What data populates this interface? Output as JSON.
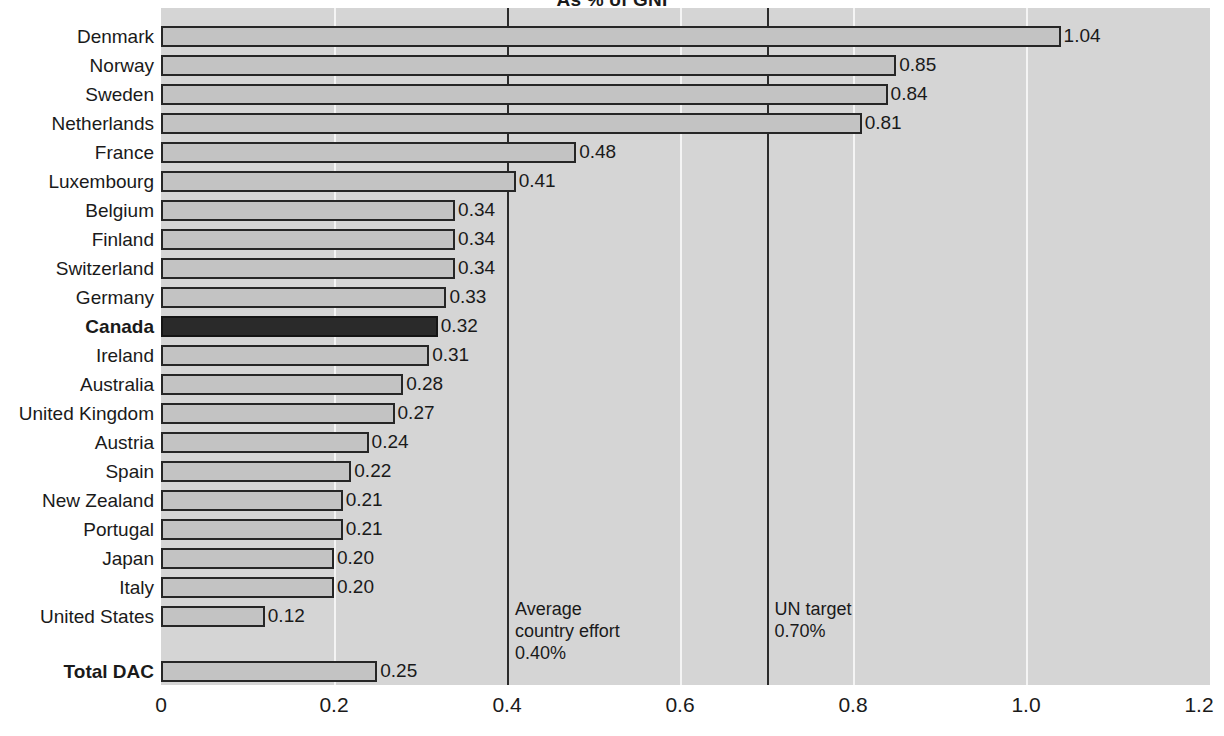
{
  "chart_data": {
    "type": "bar",
    "orientation": "horizontal",
    "title": "As % of GNI",
    "xlabel": "",
    "ylabel": "",
    "xlim": [
      0,
      1.2
    ],
    "xticks": [
      "0",
      "0.2",
      "0.4",
      "0.6",
      "0.8",
      "1.0",
      "1.2"
    ],
    "xtick_values": [
      0,
      0.2,
      0.4,
      0.6,
      0.8,
      1.0,
      1.2
    ],
    "grid": true,
    "legend": "none",
    "categories": [
      "Denmark",
      "Norway",
      "Sweden",
      "Netherlands",
      "France",
      "Luxembourg",
      "Belgium",
      "Finland",
      "Switzerland",
      "Germany",
      "Canada",
      "Ireland",
      "Australia",
      "United Kingdom",
      "Austria",
      "Spain",
      "New Zealand",
      "Portugal",
      "Japan",
      "Italy",
      "United States",
      "Total DAC"
    ],
    "values": [
      1.04,
      0.85,
      0.84,
      0.81,
      0.48,
      0.41,
      0.34,
      0.34,
      0.34,
      0.33,
      0.32,
      0.31,
      0.28,
      0.27,
      0.24,
      0.22,
      0.21,
      0.21,
      0.2,
      0.2,
      0.12,
      0.25
    ],
    "value_labels": [
      "1.04",
      "0.85",
      "0.84",
      "0.81",
      "0.48",
      "0.41",
      "0.34",
      "0.34",
      "0.34",
      "0.33",
      "0.32",
      "0.31",
      "0.28",
      "0.27",
      "0.24",
      "0.22",
      "0.21",
      "0.21",
      "0.20",
      "0.20",
      "0.12",
      "0.25"
    ],
    "highlighted": [
      "Canada"
    ],
    "emphasized": [
      "Canada",
      "Total DAC"
    ],
    "separated_after": "United States",
    "reference_lines": [
      {
        "value": 0.4,
        "label": "Average\ncountry effort\n0.40%"
      },
      {
        "value": 0.7,
        "label": "UN target\n0.70%"
      }
    ]
  },
  "bars": [
    {
      "label": "Denmark",
      "value": 1.04,
      "value_label": "1.04",
      "bold": false,
      "dark": false
    },
    {
      "label": "Norway",
      "value": 0.85,
      "value_label": "0.85",
      "bold": false,
      "dark": false
    },
    {
      "label": "Sweden",
      "value": 0.84,
      "value_label": "0.84",
      "bold": false,
      "dark": false
    },
    {
      "label": "Netherlands",
      "value": 0.81,
      "value_label": "0.81",
      "bold": false,
      "dark": false
    },
    {
      "label": "France",
      "value": 0.48,
      "value_label": "0.48",
      "bold": false,
      "dark": false
    },
    {
      "label": "Luxembourg",
      "value": 0.41,
      "value_label": "0.41",
      "bold": false,
      "dark": false
    },
    {
      "label": "Belgium",
      "value": 0.34,
      "value_label": "0.34",
      "bold": false,
      "dark": false
    },
    {
      "label": "Finland",
      "value": 0.34,
      "value_label": "0.34",
      "bold": false,
      "dark": false
    },
    {
      "label": "Switzerland",
      "value": 0.34,
      "value_label": "0.34",
      "bold": false,
      "dark": false
    },
    {
      "label": "Germany",
      "value": 0.33,
      "value_label": "0.33",
      "bold": false,
      "dark": false
    },
    {
      "label": "Canada",
      "value": 0.32,
      "value_label": "0.32",
      "bold": true,
      "dark": true
    },
    {
      "label": "Ireland",
      "value": 0.31,
      "value_label": "0.31",
      "bold": false,
      "dark": false
    },
    {
      "label": "Australia",
      "value": 0.28,
      "value_label": "0.28",
      "bold": false,
      "dark": false
    },
    {
      "label": "United Kingdom",
      "value": 0.27,
      "value_label": "0.27",
      "bold": false,
      "dark": false
    },
    {
      "label": "Austria",
      "value": 0.24,
      "value_label": "0.24",
      "bold": false,
      "dark": false
    },
    {
      "label": "Spain",
      "value": 0.22,
      "value_label": "0.22",
      "bold": false,
      "dark": false
    },
    {
      "label": "New Zealand",
      "value": 0.21,
      "value_label": "0.21",
      "bold": false,
      "dark": false
    },
    {
      "label": "Portugal",
      "value": 0.21,
      "value_label": "0.21",
      "bold": false,
      "dark": false
    },
    {
      "label": "Japan",
      "value": 0.2,
      "value_label": "0.20",
      "bold": false,
      "dark": false
    },
    {
      "label": "Italy",
      "value": 0.2,
      "value_label": "0.20",
      "bold": false,
      "dark": false
    },
    {
      "label": "United States",
      "value": 0.12,
      "value_label": "0.12",
      "bold": false,
      "dark": false
    },
    {
      "label": "Total DAC",
      "value": 0.25,
      "value_label": "0.25",
      "bold": true,
      "dark": false,
      "gap_before": true
    }
  ],
  "annotations": [
    {
      "name": "average-country-effort-note",
      "value": 0.4,
      "lines": [
        "Average",
        "country effort",
        "0.40%"
      ]
    },
    {
      "name": "un-target-note",
      "value": 0.7,
      "lines": [
        "UN target",
        "0.70%"
      ]
    }
  ],
  "axis": {
    "ticks": [
      "0",
      "0.2",
      "0.4",
      "0.6",
      "0.8",
      "1.0",
      "1.2"
    ]
  },
  "colors": {
    "plot_background": "#d5d5d5",
    "bar_fill": "#c3c3c3",
    "bar_stroke": "#262626",
    "highlight_fill": "#2a2a2a",
    "gridline": "#f4f4f4",
    "reference_line": "#2b2b2b",
    "text": "#1a1a1a"
  }
}
